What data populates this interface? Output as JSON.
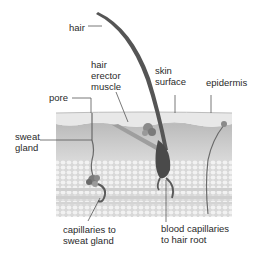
{
  "diagram": {
    "labels": {
      "hair": "hair",
      "hair_erector_muscle": "hair\nerector\nmuscle",
      "skin_surface": "skin\nsurface",
      "epidermis": "epidermis",
      "pore": "pore",
      "sweat_gland": "sweat\ngland",
      "capillaries_sweat": "capillaries to\nsweat gland",
      "capillaries_hair": "blood capillaries\nto hair root"
    },
    "colors": {
      "epidermis": "#e6e6e6",
      "dermis": "#c9c9c9",
      "fat": "#ebebeb",
      "hair": "#5a5a5a",
      "leader_line": "#555555"
    }
  }
}
